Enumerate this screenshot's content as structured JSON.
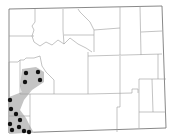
{
  "map": {
    "region": "Wyoming",
    "subdivision": "counties",
    "colors": {
      "background": "#ffffff",
      "border": "#9a9a9a",
      "range_fill": "#c4c4c4",
      "occurrence_dot": "#111111"
    },
    "range_areas": [
      "northern-lobe-sublette-lincoln",
      "southwest-corridor-lincoln-uinta-sweetwater"
    ],
    "occurrence_points": [
      {
        "x": 26,
        "y": 73
      },
      {
        "x": 38,
        "y": 72
      },
      {
        "x": 25,
        "y": 82
      },
      {
        "x": 40,
        "y": 80
      },
      {
        "x": 10,
        "y": 100
      },
      {
        "x": 11,
        "y": 109
      },
      {
        "x": 16,
        "y": 114
      },
      {
        "x": 20,
        "y": 120
      },
      {
        "x": 10,
        "y": 124
      },
      {
        "x": 12,
        "y": 130
      },
      {
        "x": 19,
        "y": 127
      },
      {
        "x": 24,
        "y": 131
      },
      {
        "x": 29,
        "y": 132
      }
    ]
  }
}
